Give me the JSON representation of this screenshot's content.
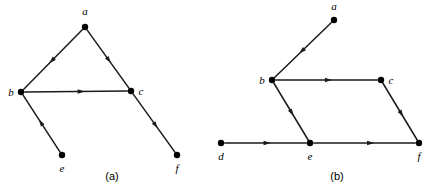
{
  "figure": {
    "background_color": "#ffffff",
    "ink_color": "#1a1a1a",
    "width": 427,
    "height": 195,
    "panels": [
      {
        "id": "panel-a",
        "caption": "(a)",
        "caption_pos": {
          "x": 112,
          "y": 180
        },
        "nodes": [
          {
            "id": "a",
            "label": "a",
            "x": 85,
            "y": 27,
            "label_x": 85,
            "label_y": 15
          },
          {
            "id": "b",
            "label": "b",
            "x": 21,
            "y": 92,
            "label_x": 11,
            "label_y": 96
          },
          {
            "id": "c",
            "label": "c",
            "x": 131,
            "y": 91,
            "label_x": 141,
            "label_y": 95
          },
          {
            "id": "e",
            "label": "e",
            "x": 62,
            "y": 155,
            "label_x": 62,
            "label_y": 172
          },
          {
            "id": "f",
            "label": "f",
            "x": 177,
            "y": 155,
            "label_x": 177,
            "label_y": 172
          }
        ],
        "edges": [
          {
            "from": "a",
            "to": "b",
            "arrow_t": 0.52,
            "label": "a-to-b"
          },
          {
            "from": "a",
            "to": "c",
            "arrow_t": 0.52,
            "label": "a-to-c"
          },
          {
            "from": "b",
            "to": "c",
            "arrow_t": 0.55,
            "label": "b-to-c"
          },
          {
            "from": "e",
            "to": "b",
            "arrow_t": 0.52,
            "label": "e-to-b"
          },
          {
            "from": "c",
            "to": "f",
            "arrow_t": 0.54,
            "label": "c-to-f"
          }
        ]
      },
      {
        "id": "panel-b",
        "caption": "(b)",
        "caption_pos": {
          "x": 337,
          "y": 180
        },
        "nodes": [
          {
            "id": "a",
            "label": "a",
            "x": 334,
            "y": 20,
            "label_x": 334,
            "label_y": 10
          },
          {
            "id": "b",
            "label": "b",
            "x": 272,
            "y": 80,
            "label_x": 262,
            "label_y": 84
          },
          {
            "id": "c",
            "label": "c",
            "x": 381,
            "y": 80,
            "label_x": 391,
            "label_y": 84
          },
          {
            "id": "d",
            "label": "d",
            "x": 221,
            "y": 143,
            "label_x": 221,
            "label_y": 160
          },
          {
            "id": "e",
            "label": "e",
            "x": 310,
            "y": 143,
            "label_x": 310,
            "label_y": 160
          },
          {
            "id": "f",
            "label": "f",
            "x": 419,
            "y": 143,
            "label_x": 419,
            "label_y": 160
          }
        ],
        "edges": [
          {
            "from": "a",
            "to": "b",
            "arrow_t": 0.52,
            "label": "a-to-b"
          },
          {
            "from": "b",
            "to": "c",
            "arrow_t": 0.52,
            "label": "b-to-c"
          },
          {
            "from": "b",
            "to": "e",
            "arrow_t": 0.52,
            "label": "b-to-e"
          },
          {
            "from": "c",
            "to": "f",
            "arrow_t": 0.54,
            "label": "c-to-f"
          },
          {
            "from": "d",
            "to": "e",
            "arrow_t": 0.52,
            "label": "d-to-e"
          },
          {
            "from": "e",
            "to": "f",
            "arrow_t": 0.56,
            "label": "e-to-f"
          }
        ]
      }
    ],
    "node_radius": 3.2,
    "arrow_size": 6.5
  }
}
